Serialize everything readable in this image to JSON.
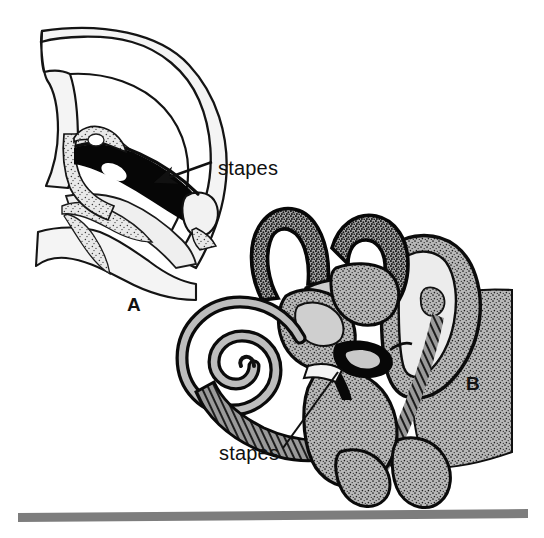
{
  "figure": {
    "background_color": "#ffffff",
    "ink_color": "#111111",
    "bone_fill": "#f2f2f2",
    "membrane_fill": "#b0b0b0",
    "hatch_color": "#1a1a1a",
    "rule_color": "#7d7d7d"
  },
  "panels": [
    {
      "id": "A",
      "panel_label": "A",
      "description": "Lateral cross-section of the skull and middle ear showing the elongated stapes with obturator foramen",
      "callouts": [
        {
          "label": "stapes",
          "pointer": "arrow",
          "target": "black elongated stapes bone with white oval foramen"
        }
      ]
    },
    {
      "id": "B",
      "panel_label": "B",
      "description": "Inner ear labyrinth: cochlear spiral, semicircular canals, vestibule and surrounding petrous bone with stirrup-shaped stapes",
      "callouts": [
        {
          "label": "stapes",
          "pointer": "leader-line",
          "target": "dark triangular stirrup-shaped stapes at oval window"
        }
      ]
    }
  ],
  "labels": {
    "stapes_a": "stapes",
    "stapes_b": "stapes",
    "panel_a": "A",
    "panel_b": "B"
  },
  "footer_rule": {
    "name": "horizontal-rule",
    "color": "#7d7d7d"
  }
}
